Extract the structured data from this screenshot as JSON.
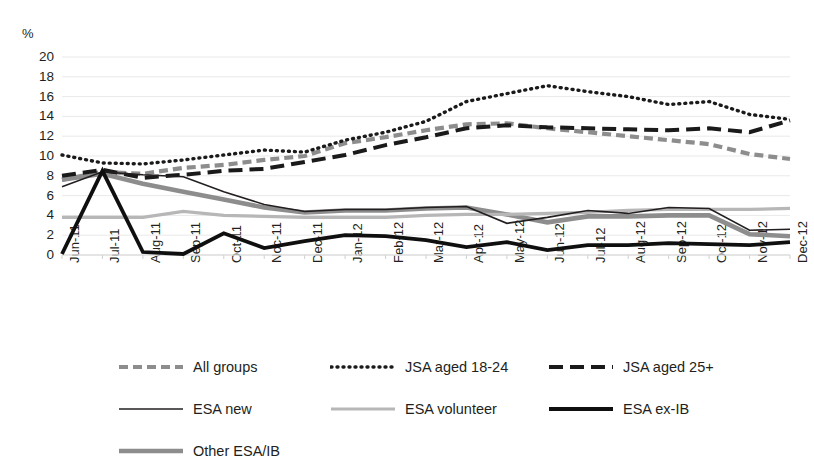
{
  "chart_data": {
    "type": "line",
    "title": "",
    "subtitle": "",
    "xlabel": "",
    "ylabel": "%",
    "ylim": [
      0,
      20
    ],
    "ytick_step": 2,
    "grid": true,
    "legend_position": "bottom",
    "yticks": [
      "20",
      "18",
      "16",
      "14",
      "12",
      "10",
      "8",
      "6",
      "4",
      "2",
      "0"
    ],
    "categories": [
      "Jun-11",
      "Jul-11",
      "Aug-11",
      "Sep-11",
      "Oct-11",
      "Noc-11",
      "Dec-11",
      "Jan-12",
      "Feb-12",
      "Mar-12",
      "Apr-12",
      "May-12",
      "Jun-12",
      "Jul-12",
      "Aug-12",
      "Sep-12",
      "Oct-12",
      "Nov-12",
      "Dec-12"
    ],
    "series": [
      {
        "name": "All groups",
        "style": "dashed",
        "color": "#8d8d8d",
        "width": 4.2,
        "dash": "9,5",
        "values": [
          7.6,
          8.4,
          8.2,
          8.8,
          9.1,
          9.6,
          10.0,
          11.3,
          11.9,
          12.6,
          13.2,
          13.3,
          12.8,
          12.4,
          12.0,
          11.6,
          11.2,
          10.2,
          9.7
        ]
      },
      {
        "name": "JSA aged 18-24",
        "style": "dotted",
        "color": "#1a1a1a",
        "width": 3.4,
        "dash": "1,5",
        "values": [
          10.1,
          9.3,
          9.2,
          9.6,
          10.1,
          10.6,
          10.4,
          11.6,
          12.4,
          13.5,
          15.5,
          16.3,
          17.1,
          16.5,
          16.0,
          15.2,
          15.5,
          14.2,
          13.7
        ]
      },
      {
        "name": "JSA aged 25+",
        "style": "dashed",
        "color": "#1a1a1a",
        "width": 4.0,
        "dash": "14,7",
        "values": [
          8.0,
          8.6,
          7.8,
          8.1,
          8.5,
          8.7,
          9.4,
          10.1,
          11.1,
          11.9,
          12.8,
          13.1,
          12.9,
          12.8,
          12.7,
          12.6,
          12.8,
          12.4,
          13.6
        ]
      },
      {
        "name": "ESA new",
        "style": "solid",
        "color": "#231f20",
        "width": 1.6,
        "dash": "",
        "values": [
          6.9,
          8.4,
          8.1,
          7.9,
          6.4,
          5.1,
          4.4,
          4.6,
          4.6,
          4.8,
          4.9,
          3.2,
          3.8,
          4.5,
          4.2,
          4.8,
          4.7,
          2.5,
          2.6
        ]
      },
      {
        "name": "ESA volunteer",
        "style": "solid",
        "color": "#b7b7b7",
        "width": 3.2,
        "dash": "",
        "values": [
          3.8,
          3.8,
          3.8,
          4.4,
          4.0,
          3.9,
          3.8,
          3.8,
          3.8,
          4.0,
          4.1,
          4.1,
          4.2,
          4.3,
          4.5,
          4.6,
          4.6,
          4.6,
          4.7
        ]
      },
      {
        "name": "ESA ex-IB",
        "style": "solid",
        "color": "#0f0f0f",
        "width": 3.8,
        "dash": "",
        "values": [
          0.1,
          8.5,
          0.3,
          0.1,
          2.2,
          0.7,
          1.4,
          2.0,
          1.9,
          1.5,
          0.8,
          1.3,
          0.5,
          1.0,
          1.0,
          1.2,
          1.1,
          1.0,
          1.3
        ]
      },
      {
        "name": "Other ESA/IB",
        "style": "solid",
        "color": "#8d8d8d",
        "width": 4.6,
        "dash": "",
        "values": [
          7.6,
          8.2,
          7.2,
          6.4,
          5.6,
          4.8,
          4.3,
          4.5,
          4.5,
          4.7,
          4.8,
          4.1,
          3.3,
          3.9,
          3.9,
          4.0,
          4.0,
          2.1,
          1.9
        ]
      }
    ]
  },
  "legend": {
    "rows": [
      [
        {
          "label": "All groups",
          "key": "All groups"
        },
        {
          "label": "JSA aged 18-24",
          "key": "JSA aged 18-24"
        },
        {
          "label": "JSA aged 25+",
          "key": "JSA aged 25+"
        }
      ],
      [
        {
          "label": "ESA new",
          "key": "ESA new"
        },
        {
          "label": "ESA volunteer",
          "key": "ESA volunteer"
        },
        {
          "label": "ESA ex-IB",
          "key": "ESA ex-IB"
        }
      ],
      [
        {
          "label": "Other ESA/IB",
          "key": "Other ESA/IB"
        }
      ]
    ]
  }
}
